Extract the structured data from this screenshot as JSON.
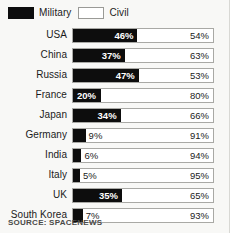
{
  "legend": {
    "items": [
      {
        "label": "Military",
        "swatch": "military-swatch",
        "color": "#0d0d0d"
      },
      {
        "label": "Civil",
        "swatch": "civil-swatch",
        "color": "#ffffff"
      }
    ]
  },
  "source": "SOURCE: SPACENEWS",
  "colors": {
    "military": "#0d0d0d",
    "civil": "#ffffff",
    "background": "#f8f8f6",
    "track_border": "#a9a9a5",
    "text": "#1b1b1b"
  },
  "chart_data": {
    "type": "bar",
    "title": "",
    "subtitle": "",
    "xlabel": "",
    "ylabel": "",
    "orientation": "horizontal",
    "stacked": true,
    "unit": "%",
    "xlim": [
      0,
      100
    ],
    "grid": false,
    "legend_position": "top-left",
    "categories": [
      "USA",
      "China",
      "Russia",
      "France",
      "Japan",
      "Germany",
      "India",
      "Italy",
      "UK",
      "South Korea"
    ],
    "series": [
      {
        "name": "Military",
        "values": [
          46,
          37,
          47,
          20,
          34,
          9,
          6,
          5,
          35,
          7
        ]
      },
      {
        "name": "Civil",
        "values": [
          54,
          63,
          53,
          80,
          66,
          91,
          94,
          95,
          65,
          93
        ]
      }
    ],
    "rows": [
      {
        "country": "USA",
        "military": 46,
        "civil": 54,
        "military_text": "46%",
        "civil_text": "54%"
      },
      {
        "country": "China",
        "military": 37,
        "civil": 63,
        "military_text": "37%",
        "civil_text": "63%"
      },
      {
        "country": "Russia",
        "military": 47,
        "civil": 53,
        "military_text": "47%",
        "civil_text": "53%"
      },
      {
        "country": "France",
        "military": 20,
        "civil": 80,
        "military_text": "20%",
        "civil_text": "80%"
      },
      {
        "country": "Japan",
        "military": 34,
        "civil": 66,
        "military_text": "34%",
        "civil_text": "66%"
      },
      {
        "country": "Germany",
        "military": 9,
        "civil": 91,
        "military_text": "9%",
        "civil_text": "91%"
      },
      {
        "country": "India",
        "military": 6,
        "civil": 94,
        "military_text": "6%",
        "civil_text": "94%"
      },
      {
        "country": "Italy",
        "military": 5,
        "civil": 95,
        "military_text": "5%",
        "civil_text": "95%"
      },
      {
        "country": "UK",
        "military": 35,
        "civil": 65,
        "military_text": "35%",
        "civil_text": "65%"
      },
      {
        "country": "South Korea",
        "military": 7,
        "civil": 93,
        "military_text": "7%",
        "civil_text": "93%"
      }
    ]
  }
}
